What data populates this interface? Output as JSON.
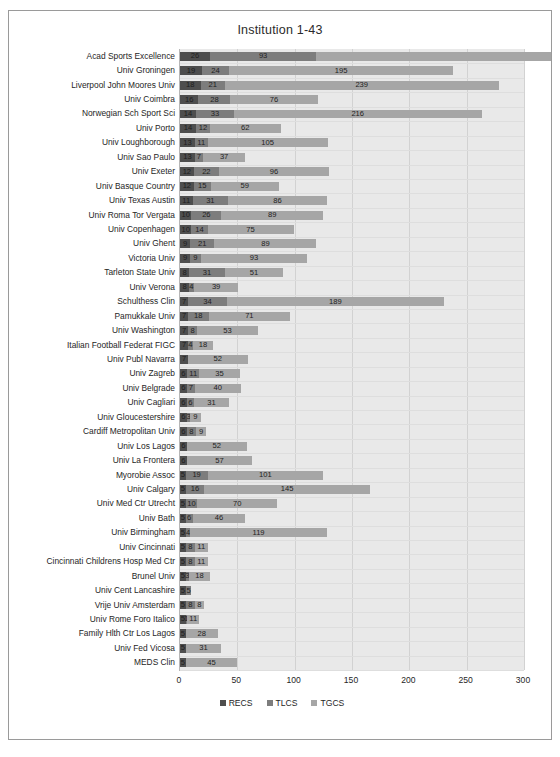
{
  "chart_data": {
    "type": "bar",
    "orientation": "horizontal",
    "stacked": true,
    "title": "Institution 1-43",
    "xlabel": "",
    "ylabel": "",
    "xlim": [
      0,
      300
    ],
    "xticks": [
      0,
      50,
      100,
      150,
      200,
      250,
      300
    ],
    "grid": true,
    "legend_position": "bottom",
    "legend": [
      "RECS",
      "TLCS",
      "TGCS"
    ],
    "series": [
      {
        "name": "RECS",
        "color": "#4e4e4e",
        "values": [
          26,
          19,
          18,
          16,
          14,
          14,
          13,
          13,
          12,
          12,
          11,
          10,
          10,
          9,
          9,
          8,
          8,
          7,
          7,
          7,
          7,
          7,
          6,
          6,
          6,
          6,
          6,
          6,
          6,
          5,
          5,
          5,
          5,
          5,
          5,
          5,
          5,
          5,
          5,
          5,
          5,
          5,
          5
        ]
      },
      {
        "name": "TLCS",
        "color": "#7d7d7d",
        "values": [
          93,
          24,
          21,
          28,
          33,
          12,
          11,
          7,
          22,
          15,
          31,
          26,
          14,
          21,
          9,
          31,
          4,
          34,
          18,
          8,
          4,
          0,
          11,
          7,
          6,
          3,
          8,
          0,
          0,
          19,
          16,
          10,
          6,
          4,
          8,
          8,
          3,
          5,
          8,
          1,
          0,
          0,
          0
        ]
      },
      {
        "name": "TGCS",
        "color": "#a6a6a6",
        "values": [
          545,
          195,
          239,
          76,
          216,
          62,
          105,
          37,
          96,
          59,
          86,
          89,
          75,
          89,
          93,
          51,
          39,
          189,
          71,
          53,
          18,
          52,
          35,
          40,
          31,
          9,
          9,
          52,
          57,
          101,
          145,
          70,
          46,
          119,
          11,
          11,
          18,
          0,
          8,
          11,
          28,
          31,
          45
        ]
      }
    ],
    "categories": [
      "Acad Sports Excellence",
      "Univ Groningen",
      "Liverpool John Moores Univ",
      "Univ Coimbra",
      "Norwegian Sch Sport Sci",
      "Univ Porto",
      "Univ Loughborough",
      "Univ Sao Paulo",
      "Univ Exeter",
      "Univ Basque Country",
      "Univ Texas Austin",
      "Univ Roma Tor Vergata",
      "Univ Copenhagen",
      "Univ Ghent",
      "Victoria Univ",
      "Tarleton State Univ",
      "Univ Verona",
      "Schulthess Clin",
      "Pamukkale Univ",
      "Univ Washington",
      "Italian Football Federat FIGC",
      "Univ Publ Navarra",
      "Univ Zagreb",
      "Univ Belgrade",
      "Univ Cagliari",
      "Univ Gloucestershire",
      "Cardiff Metropolitan Univ",
      "Univ Los Lagos",
      "Univ La Frontera",
      "Myorobie Assoc",
      "Univ Calgary",
      "Univ Med Ctr Utrecht",
      "Univ Bath",
      "Univ Birmingham",
      "Univ Cincinnati",
      "Cincinnati Childrens Hosp Med Ctr",
      "Brunel Univ",
      "Univ Cent Lancashire",
      "Vrije Univ Amsterdam",
      "Univ Rome Foro Italico",
      "Family Hlth Ctr Los Lagos",
      "Univ Fed Vicosa",
      "MEDS Clin"
    ]
  }
}
